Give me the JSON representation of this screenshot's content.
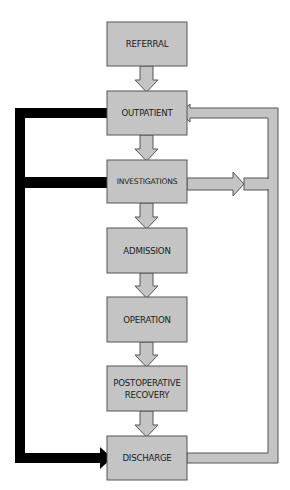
{
  "diagram": {
    "type": "flowchart",
    "colors": {
      "box_fill": "#c4c4c4",
      "box_stroke": "#555555",
      "arrow_fill": "#c4c4c4",
      "arrow_stroke": "#555555",
      "bypass_path": "#000000",
      "background": "#ffffff"
    },
    "nodes": [
      {
        "id": "referral",
        "label": "REFERRAL"
      },
      {
        "id": "outpatient",
        "label": "OUTPATIENT"
      },
      {
        "id": "investigations",
        "label": "INVESTIGATIONS"
      },
      {
        "id": "admission",
        "label": "ADMISSION"
      },
      {
        "id": "operation",
        "label": "OPERATION"
      },
      {
        "id": "postoperative",
        "label_line1": "POSTOPERATIVE",
        "label_line2": "RECOVERY"
      },
      {
        "id": "discharge",
        "label": "DISCHARGE"
      }
    ],
    "edges": [
      {
        "from": "referral",
        "to": "outpatient",
        "style": "grey-arrow"
      },
      {
        "from": "outpatient",
        "to": "investigations",
        "style": "grey-arrow"
      },
      {
        "from": "investigations",
        "to": "admission",
        "style": "grey-arrow"
      },
      {
        "from": "admission",
        "to": "operation",
        "style": "grey-arrow"
      },
      {
        "from": "operation",
        "to": "postoperative",
        "style": "grey-arrow"
      },
      {
        "from": "postoperative",
        "to": "discharge",
        "style": "grey-arrow"
      },
      {
        "from": "discharge",
        "to": "outpatient",
        "style": "grey-loop-right"
      },
      {
        "from": "investigations",
        "to": "right-loop",
        "style": "grey-arrow-right"
      },
      {
        "from": "outpatient",
        "to": "discharge",
        "style": "black-bypass-left"
      },
      {
        "from": "investigations",
        "to": "discharge",
        "style": "black-bypass-left"
      }
    ]
  }
}
